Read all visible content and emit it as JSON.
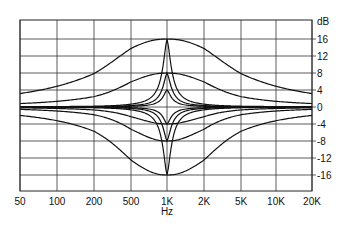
{
  "chart_data": {
    "type": "line",
    "title": "",
    "xlabel": "Hz",
    "ylabel": "dB",
    "x_scale": "log",
    "x_tick_labels": [
      "50",
      "100",
      "200",
      "500",
      "1K",
      "2K",
      "5K",
      "10K",
      "20K"
    ],
    "x_tick_values": [
      50,
      100,
      200,
      500,
      1000,
      2000,
      5000,
      10000,
      20000
    ],
    "y_tick_labels": [
      "16",
      "12",
      "8",
      "4",
      "0",
      "-4",
      "-8",
      "-12",
      "-16"
    ],
    "y_tick_values": [
      16,
      12,
      8,
      4,
      0,
      -4,
      -8,
      -12,
      -16
    ],
    "ylim": [
      -20,
      20
    ],
    "xlim": [
      50,
      20000
    ],
    "grid": true,
    "legend": null,
    "center_frequency_hz": 1000,
    "series": [
      {
        "name": "Boost +16 dB, wide",
        "gain_db": 16,
        "bandwidth": "wide",
        "q": 0.35
      },
      {
        "name": "Boost +16 dB, narrow",
        "gain_db": 16,
        "bandwidth": "narrow",
        "q": 2.2
      },
      {
        "name": "Boost +8 dB, wide",
        "gain_db": 8,
        "bandwidth": "wide",
        "q": 0.5
      },
      {
        "name": "Boost +8 dB, narrow",
        "gain_db": 8,
        "bandwidth": "narrow",
        "q": 2.2
      },
      {
        "name": "Boost +4 dB, narrow",
        "gain_db": 4,
        "bandwidth": "narrow",
        "q": 2.2
      },
      {
        "name": "Cut -4 dB, medium",
        "gain_db": -4,
        "bandwidth": "medium",
        "q": 0.7
      },
      {
        "name": "Cut -4 dB, narrow",
        "gain_db": -4,
        "bandwidth": "narrow",
        "q": 2.2
      },
      {
        "name": "Cut -8 dB, medium",
        "gain_db": -8,
        "bandwidth": "medium",
        "q": 0.6
      },
      {
        "name": "Cut -8 dB, narrow",
        "gain_db": -8,
        "bandwidth": "narrow",
        "q": 2.2
      },
      {
        "name": "Cut -16 dB, wide",
        "gain_db": -16,
        "bandwidth": "wide",
        "q": 0.45
      },
      {
        "name": "Cut -16 dB, narrow",
        "gain_db": -16,
        "bandwidth": "narrow",
        "q": 2.2
      }
    ]
  }
}
